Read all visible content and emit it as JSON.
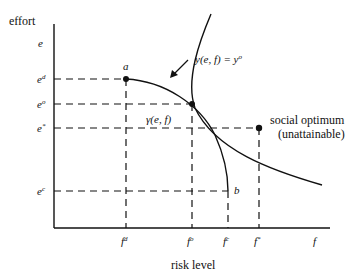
{
  "y_axis": {
    "title": "effort",
    "var": "e",
    "ticks": [
      {
        "base": "e",
        "sup": "d"
      },
      {
        "base": "e",
        "sup": "o"
      },
      {
        "base": "e",
        "sup": "*"
      },
      {
        "base": "e",
        "sup": "c"
      }
    ]
  },
  "x_axis": {
    "title": "risk level",
    "var": "f",
    "ticks": [
      {
        "base": "f",
        "sup": "d"
      },
      {
        "base": "f",
        "sup": "o"
      },
      {
        "base": "f",
        "sup": "c"
      },
      {
        "base": "f",
        "sup": "*"
      }
    ]
  },
  "points": {
    "a": "a",
    "b": "b"
  },
  "curves": {
    "frontier_label": "γ(e, f)",
    "indifference_label": "y(e, f) = y",
    "indifference_sup": "o"
  },
  "social_optimum": {
    "line1": "social optimum",
    "line2": "(unattainable)"
  },
  "colors": {
    "ink": "#111111",
    "background": "#ffffff"
  }
}
